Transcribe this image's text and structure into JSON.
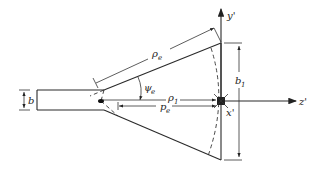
{
  "diagram": {
    "type": "E-plane sectoral horn geometry",
    "labels": {
      "y_axis": "y'",
      "z_axis": "z'",
      "x_axis": "x'",
      "aperture_height": "b",
      "aperture_height_sub": "1",
      "waveguide_height": "b",
      "slant_length": "ρ",
      "slant_length_sub": "e",
      "flare_angle": "ψ",
      "flare_angle_sub": "e",
      "axial_length": "ρ",
      "axial_length_sub": "1",
      "horn_length": "p",
      "horn_length_sub": "e"
    },
    "colors": {
      "line": "#2a2a2a",
      "background": "#ffffff"
    }
  }
}
